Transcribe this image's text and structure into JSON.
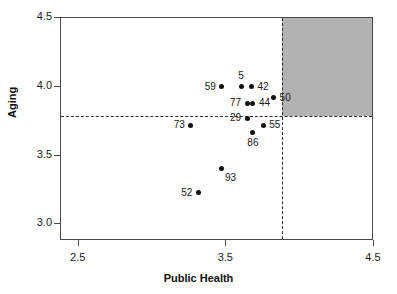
{
  "chart_data": {
    "type": "scatter",
    "title": "",
    "xlabel": "Public Health",
    "ylabel": "Aging",
    "xlim": [
      2.38,
      4.5
    ],
    "ylim": [
      2.88,
      4.5
    ],
    "xticks": [
      "2.5",
      "3.5",
      "4.5"
    ],
    "xtick_values": [
      2.5,
      3.5,
      4.5
    ],
    "yticks": [
      "3.0",
      "3.5",
      "4.0",
      "4.5"
    ],
    "ytick_values": [
      3.0,
      3.5,
      4.0,
      4.5
    ],
    "grid": false,
    "legend": "none",
    "reference_lines": {
      "vertical_x": 3.88,
      "horizontal_y": 3.79,
      "style": "dashed"
    },
    "shaded_region": {
      "description": "upper-right quadrant highlighted in gray",
      "x_from": 3.88,
      "x_to": 4.5,
      "y_from": 3.79,
      "y_to": 4.5,
      "color": "#b2b2b2"
    },
    "points": [
      {
        "label": "59",
        "x": 3.47,
        "y": 4.0,
        "label_pos": "left"
      },
      {
        "label": "5",
        "x": 3.6,
        "y": 4.0,
        "label_pos": "above"
      },
      {
        "label": "42",
        "x": 3.67,
        "y": 4.0,
        "label_pos": "right"
      },
      {
        "label": "77",
        "x": 3.64,
        "y": 3.88,
        "label_pos": "left"
      },
      {
        "label": "44",
        "x": 3.68,
        "y": 3.88,
        "label_pos": "right"
      },
      {
        "label": "50",
        "x": 3.82,
        "y": 3.92,
        "label_pos": "right"
      },
      {
        "label": "29",
        "x": 3.64,
        "y": 3.77,
        "label_pos": "left"
      },
      {
        "label": "86",
        "x": 3.68,
        "y": 3.67,
        "label_pos": "below"
      },
      {
        "label": "55",
        "x": 3.75,
        "y": 3.72,
        "label_pos": "right"
      },
      {
        "label": "73",
        "x": 3.26,
        "y": 3.72,
        "label_pos": "left"
      },
      {
        "label": "93",
        "x": 3.47,
        "y": 3.41,
        "label_pos": "below-right"
      },
      {
        "label": "52",
        "x": 3.31,
        "y": 3.23,
        "label_pos": "left"
      }
    ]
  },
  "colors": {
    "point": "#111111",
    "axis": "#4a4a4a",
    "shade": "#b2b2b2",
    "text": "#1a1a1a",
    "background": "#ffffff"
  }
}
